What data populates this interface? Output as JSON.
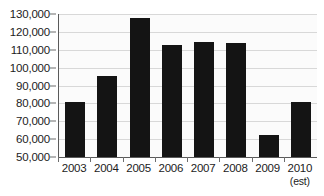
{
  "chart_data": {
    "type": "bar",
    "title": "",
    "subtitle": "",
    "xlabel": "",
    "ylabel": "",
    "categories": [
      "2003",
      "2004",
      "2005",
      "2006",
      "2007",
      "2008",
      "2009",
      "2010"
    ],
    "category_sublabels": [
      "",
      "",
      "",
      "",
      "",
      "",
      "",
      "(est)"
    ],
    "values": [
      80500,
      95200,
      127500,
      112600,
      114600,
      113700,
      62500,
      80500
    ],
    "series": [
      {
        "name": "",
        "values": [
          80500,
          95200,
          127500,
          112600,
          114600,
          113700,
          62500,
          80500
        ]
      }
    ],
    "ylim": [
      50000,
      130000
    ],
    "ytick_values": [
      130000,
      120000,
      110000,
      100000,
      90000,
      80000,
      70000,
      60000,
      50000
    ],
    "ytick_labels": [
      "130,000",
      "120,000",
      "110,000",
      "100,000",
      "90,000",
      "80,000",
      "70,000",
      "60,000",
      "50,000"
    ],
    "grid": true,
    "legend": false,
    "legend_position": "none",
    "annotations": [
      "(est)"
    ],
    "colors": {
      "bar": "#141414",
      "plot_background": "#fbfbfb",
      "gridline": "#d8d8d8",
      "axis": "#5a5a5a",
      "text": "#1c1c1c"
    }
  }
}
